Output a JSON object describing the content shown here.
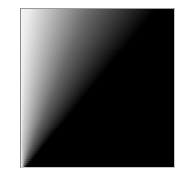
{
  "figure": {
    "colors": {
      "light": "#ffffff",
      "dark": "#000000",
      "border": "#9a9a9a"
    },
    "gradient": {
      "rows": 80,
      "fade_width_top_pct": 88,
      "fade_width_bottom_pct": 4,
      "start_light_level_top": 235,
      "start_light_level_bottom": 200
    }
  }
}
